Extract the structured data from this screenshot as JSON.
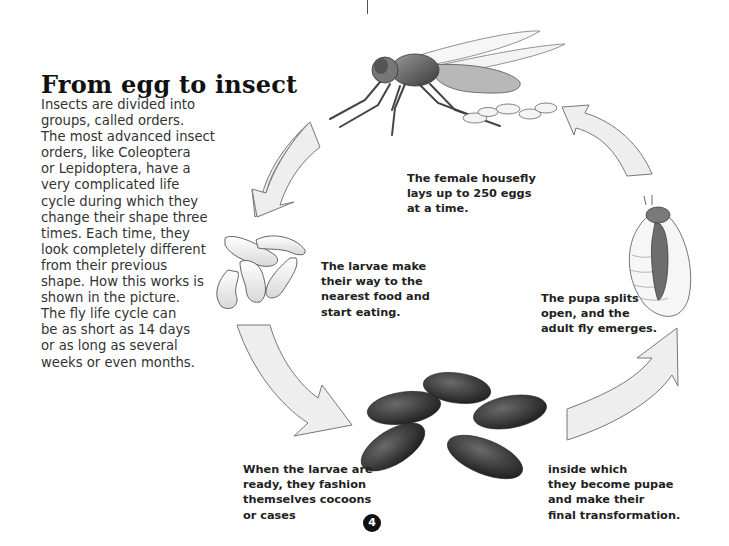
{
  "page": {
    "title": "From egg to insect",
    "intro_lines": [
      "Insects are divided into",
      "groups, called orders.",
      "The most advanced insect",
      "orders, like Coleoptera",
      "or Lepidoptera, have a",
      "very complicated life",
      "cycle during which they",
      "change their shape three",
      "times. Each time, they",
      "look completely different",
      "from their previous",
      "shape. How this works is",
      "shown in the picture.",
      "The fly life cycle can",
      "be as short as 14 days",
      "or as long as several",
      "weeks or even months."
    ],
    "page_number": "4"
  },
  "diagram": {
    "stages": [
      {
        "name": "adult-fly",
        "caption_lines": [
          "The female housefly",
          "lays up to 250 eggs",
          "at a time."
        ]
      },
      {
        "name": "larvae",
        "caption_lines": [
          "The larvae make",
          "their way to the",
          "nearest food and",
          "start eating."
        ]
      },
      {
        "name": "cocoons",
        "caption_lines": [
          "When the larvae are",
          "ready, they fashion",
          "themselves cocoons",
          "or cases"
        ]
      },
      {
        "name": "pupae",
        "caption_lines": [
          "inside which",
          "they become pupae",
          "and make their",
          "final transformation."
        ]
      },
      {
        "name": "emerging-fly",
        "caption_lines": [
          "The pupa splits",
          "open, and the",
          "adult fly emerges."
        ]
      }
    ],
    "colors": {
      "arrow_fill": "#eeeeee",
      "arrow_stroke": "#777777",
      "cocoon": "#3a3a3a",
      "text": "#222222"
    }
  }
}
